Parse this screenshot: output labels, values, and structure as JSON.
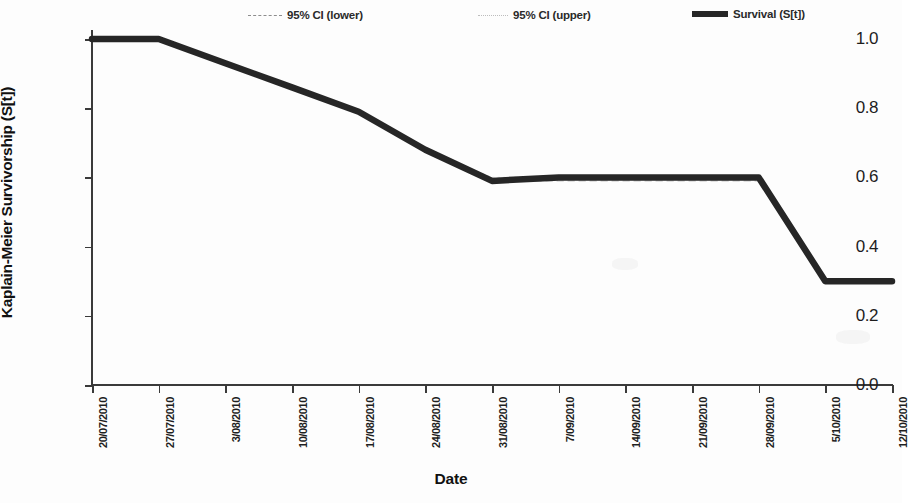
{
  "chart_data": {
    "type": "line",
    "title": "",
    "xlabel": "Date",
    "ylabel": "Kaplain-Meier Survivorship (S[t])",
    "ylim": [
      0.0,
      1.0
    ],
    "yticks": [
      "0.0",
      "0.2",
      "0.4",
      "0.6",
      "0.8",
      "1.0"
    ],
    "ytick_values": [
      0.0,
      0.2,
      0.4,
      0.6,
      0.8,
      1.0
    ],
    "grid": false,
    "legend_position": "top",
    "categories": [
      "20/07/2010",
      "27/07/2010",
      "3/08/2010",
      "10/08/2010",
      "17/08/2010",
      "24/08/2010",
      "31/08/2010",
      "7/09/2010",
      "14/09/2010",
      "21/09/2010",
      "28/09/2010",
      "5/10/2010",
      "12/10/2010"
    ],
    "series": [
      {
        "name": "95% CI (lower)",
        "style": "dashed",
        "color": "#8d8d8d",
        "values": [
          1.0,
          1.0,
          0.93,
          0.86,
          0.79,
          0.68,
          0.59,
          0.59,
          0.59,
          0.59,
          0.59,
          0.3,
          0.3
        ]
      },
      {
        "name": "95% CI (upper)",
        "style": "dotted",
        "color": "#bdbdbd",
        "values": [
          1.0,
          1.0,
          0.93,
          0.86,
          0.79,
          0.68,
          0.6,
          0.6,
          0.6,
          0.6,
          0.6,
          0.3,
          0.3
        ]
      },
      {
        "name": "Survival (S[t])",
        "style": "solid",
        "color": "#262626",
        "values": [
          1.0,
          1.0,
          0.93,
          0.86,
          0.79,
          0.68,
          0.59,
          0.6,
          0.6,
          0.6,
          0.6,
          0.3,
          0.3
        ]
      }
    ]
  },
  "legend": {
    "items": [
      {
        "label": "95% CI (lower)",
        "marker": "dashed-line-icon"
      },
      {
        "label": "95% CI (upper)",
        "marker": "dotted-line-icon"
      },
      {
        "label": "Survival (S[t])",
        "marker": "solid-line-icon"
      }
    ]
  },
  "axes": {
    "y_title": "Kaplain-Meier Survivorship (S[t])",
    "x_title": "Date"
  }
}
